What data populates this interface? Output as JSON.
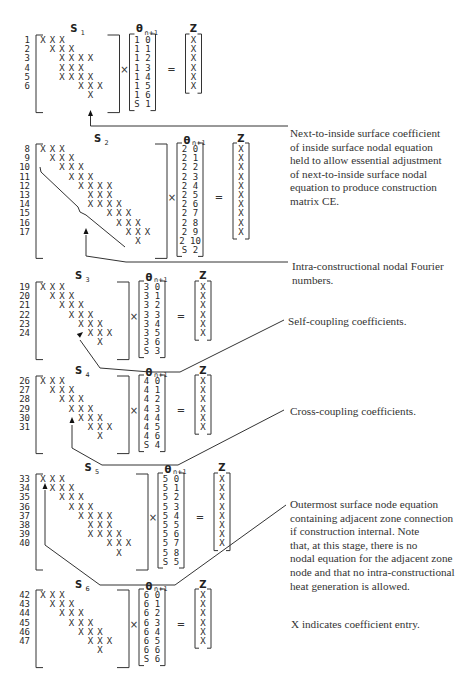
{
  "matrices": [
    {
      "id": "S1",
      "label": "S",
      "subscript": "1",
      "rows": [
        "1",
        "2",
        "3",
        "4",
        "5",
        "6"
      ],
      "theta_label": "θ",
      "theta_sub": "n+1",
      "theta_entries": [
        "1 0",
        "1 1",
        "1 2",
        "1 3",
        "1 4",
        "1 5",
        "1 6",
        "S 1"
      ],
      "z_label": "Z",
      "z_count": 6
    },
    {
      "id": "S2",
      "label": "S",
      "subscript": "2",
      "rows": [
        "8",
        "9",
        "10",
        "11",
        "12",
        "13",
        "14",
        "15",
        "16",
        "17"
      ],
      "theta_label": "θ",
      "theta_sub": "n+1",
      "theta_entries": [
        "2 0",
        "2 1",
        "2 2",
        "2 3",
        "2 4",
        "2 5",
        "2 6",
        "2 7",
        "2 8",
        "2 9",
        "2 10",
        "S 2"
      ],
      "z_label": "Z",
      "z_count": 10
    },
    {
      "id": "S3",
      "label": "S",
      "subscript": "3",
      "rows": [
        "19",
        "20",
        "21",
        "22",
        "23",
        "24"
      ],
      "theta_label": "θ",
      "theta_sub": "n+1",
      "theta_entries": [
        "3 0",
        "3 1",
        "3 2",
        "3 3",
        "3 4",
        "3 5",
        "3 6",
        "S 3"
      ],
      "z_label": "Z",
      "z_count": 6
    },
    {
      "id": "S4",
      "label": "S",
      "subscript": "4",
      "rows": [
        "26",
        "27",
        "28",
        "29",
        "30",
        "31"
      ],
      "theta_label": "θ",
      "theta_sub": "n+1",
      "theta_entries": [
        "4 0",
        "4 1",
        "4 2",
        "4 3",
        "4 4",
        "4 5",
        "4 6",
        "S 4"
      ],
      "z_label": "Z",
      "z_count": 6
    },
    {
      "id": "S5",
      "label": "S",
      "subscript": "5",
      "rows": [
        "33",
        "34",
        "35",
        "36",
        "37",
        "38",
        "39",
        "40"
      ],
      "theta_label": "θ",
      "theta_sub": "n+1",
      "theta_entries": [
        "5 0",
        "5 1",
        "5 2",
        "5 3",
        "5 4",
        "5 5",
        "5 6",
        "5 7",
        "5 8",
        "S 5"
      ],
      "z_label": "Z",
      "z_count": 8
    },
    {
      "id": "S6",
      "label": "S",
      "subscript": "6",
      "rows": [
        "42",
        "43",
        "44",
        "45",
        "46",
        "47"
      ],
      "theta_label": "θ",
      "theta_sub": "n+1",
      "theta_entries": [
        "6 0",
        "6 1",
        "6 2",
        "6 3",
        "6 4",
        "6 5",
        "6 6",
        "S 6"
      ],
      "z_label": "Z",
      "z_count": 6
    }
  ],
  "symbols": {
    "entry": "X",
    "times": "×",
    "equals": "="
  },
  "annotations": {
    "next_to_inside": "Next-to-inside surface coefficient\nof inside surface nodal equation\nheld to allow essential adjustment\nof next-to-inside surface nodal\nequation to produce construction\nmatrix CE.",
    "fourier": "Intra-constructional nodal Fourier\nnumbers.",
    "self_coupling": "Self-coupling coefficients.",
    "cross_coupling": "Cross-coupling coefficients.",
    "outermost": "Outermost surface node equation\ncontaining adjacent zone connection\nif construction internal. Note\nthat, at this stage, there is no\nnodal equation for the adjacent zone\nnode and that no intra-constructional\nheat generation is allowed.",
    "legend": "X indicates coefficient entry."
  }
}
